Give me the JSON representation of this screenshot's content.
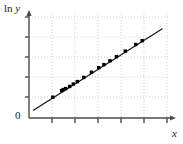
{
  "figure": {
    "ylabel_prefix": "ln ",
    "ylabel_var": "y",
    "xlabel": "x",
    "origin_label": "0"
  },
  "colors": {
    "axis": "#4a4a4a",
    "grid": "#cfcfcf",
    "fit_line": "#111111",
    "point": "#000000",
    "background": "#ffffff"
  },
  "chart_data": {
    "type": "scatter",
    "title": "",
    "xlabel": "x",
    "ylabel": "ln y",
    "grid": true,
    "legend": null,
    "xlim": [
      0,
      7
    ],
    "ylim": [
      0,
      6
    ],
    "xticks": [
      1,
      2,
      3,
      4,
      5,
      6
    ],
    "yticks": [
      1,
      2,
      3,
      4,
      5
    ],
    "tick_labels_shown": false,
    "origin_label": "0",
    "series": [
      {
        "name": "data points",
        "marker": "filled-square",
        "x": [
          1.18,
          1.62,
          1.7,
          1.82,
          2.02,
          2.2,
          2.4,
          2.72,
          3.1,
          3.46,
          3.72,
          4.02,
          4.34,
          4.78,
          5.3,
          5.62
        ],
        "y": [
          1.2,
          1.58,
          1.64,
          1.7,
          1.82,
          1.96,
          2.1,
          2.34,
          2.64,
          2.9,
          3.08,
          3.3,
          3.54,
          3.86,
          4.24,
          4.46
        ]
      }
    ],
    "fit_line": {
      "name": "least-squares fit",
      "x": [
        0.22,
        6.6
      ],
      "y": [
        0.45,
        5.14
      ],
      "slope": 0.735,
      "intercept": 0.29
    }
  }
}
